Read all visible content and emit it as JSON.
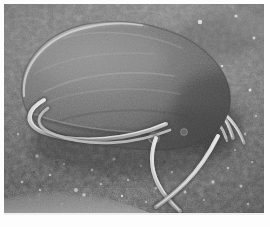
{
  "figure": {
    "kind": "sem-micrograph",
    "modality": "Scanning electron microscopy",
    "color_mode": "grayscale",
    "width_px": 270,
    "height_px": 227,
    "border": {
      "color": "#ffffff",
      "top_px": 4,
      "left_px": 4,
      "right_px": 6,
      "bottom_px": 14
    },
    "caption_text": "",
    "scale_bar_text": "",
    "annotation_text": "",
    "magnification_text": "",
    "has_visible_text": false
  },
  "palette": {
    "background_dark": "#4a4a4a",
    "background_mid": "#6b6b6b",
    "background_light": "#8f8f8f",
    "speck_highlight": "#d8d8d8",
    "body_dark": "#545454",
    "body_mid": "#6f6f6f",
    "body_light": "#9a9a9a",
    "body_rim_highlight": "#c9c9c9",
    "flagellum_core": "#d5d5d5",
    "flagellum_edge": "#8a8a8a",
    "shadow": "#2e2e2e",
    "frame": "#ffffff"
  },
  "scene": {
    "substrate": {
      "name": "granular filter substrate",
      "texture": "mottled granular",
      "tone": "mid-gray",
      "speck_count": 46
    },
    "organism": {
      "name": "Giardia trophozoite",
      "shape": "pear / teardrop",
      "orientation": "anterior upper-left, posterior lower-right",
      "body": {
        "center_x_px": 112,
        "center_y_px": 78,
        "width_px": 176,
        "height_px": 104,
        "rotation_deg": -14
      },
      "surface_features": [
        {
          "name": "dorsal-rim-highlight",
          "x_px": 44,
          "y_px": 40
        },
        {
          "name": "ventral-disc-margin",
          "x_px": 96,
          "y_px": 124
        },
        {
          "name": "surface-bleb",
          "x_px": 150,
          "y_px": 134,
          "r_px": 5
        },
        {
          "name": "posterior-shadow",
          "x_px": 196,
          "y_px": 112
        }
      ],
      "flagella": [
        {
          "name": "anteroventral-flagellum-left",
          "label": "flagellum 1"
        },
        {
          "name": "ventral-flagellum",
          "label": "flagellum 2"
        },
        {
          "name": "caudal-flagellum-anterior",
          "label": "flagellum 3"
        },
        {
          "name": "caudal-flagellum-posterior",
          "label": "flagellum 4"
        },
        {
          "name": "posterolateral-flagellum-upper",
          "label": "flagellum 5"
        },
        {
          "name": "posterolateral-flagellum-lower",
          "label": "flagellum 6"
        },
        {
          "name": "posterolateral-flagellum-short",
          "label": "flagellum 7"
        },
        {
          "name": "posterolateral-flagellum-stub",
          "label": "flagellum 8"
        }
      ],
      "flagella_count": 8
    },
    "foreground_ridge": {
      "name": "substrate-ridge",
      "position": "bottom-left",
      "tone": "light-gray"
    }
  }
}
